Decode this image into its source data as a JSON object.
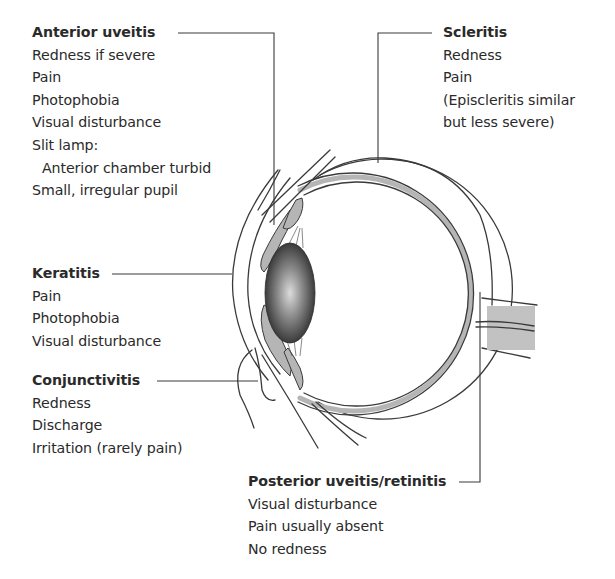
{
  "diagram": {
    "colors": {
      "line": "#3a3a3a",
      "tissue_fill": "#b5b5b5",
      "lens_dark": "#2b2b2b",
      "lens_light": "#d8d8d8",
      "text": "#2a2a2a"
    }
  },
  "labels": {
    "anterior_uveitis": {
      "title": "Anterior uveitis",
      "lines": [
        "Redness if severe",
        "Pain",
        "Photophobia",
        "Visual disturbance",
        "Slit lamp:",
        "Anterior chamber turbid",
        "Small, irregular pupil"
      ]
    },
    "scleritis": {
      "title": "Scleritis",
      "lines": [
        "Redness",
        "Pain",
        "(Episcleritis similar",
        "but less severe)"
      ]
    },
    "keratitis": {
      "title": "Keratitis",
      "lines": [
        "Pain",
        "Photophobia",
        "Visual disturbance"
      ]
    },
    "conjunctivitis": {
      "title": "Conjunctivitis",
      "lines": [
        "Redness",
        "Discharge",
        "Irritation (rarely pain)"
      ]
    },
    "posterior_uveitis": {
      "title": "Posterior uveitis/retinitis",
      "lines": [
        "Visual disturbance",
        "Pain usually absent",
        "No redness"
      ]
    }
  }
}
